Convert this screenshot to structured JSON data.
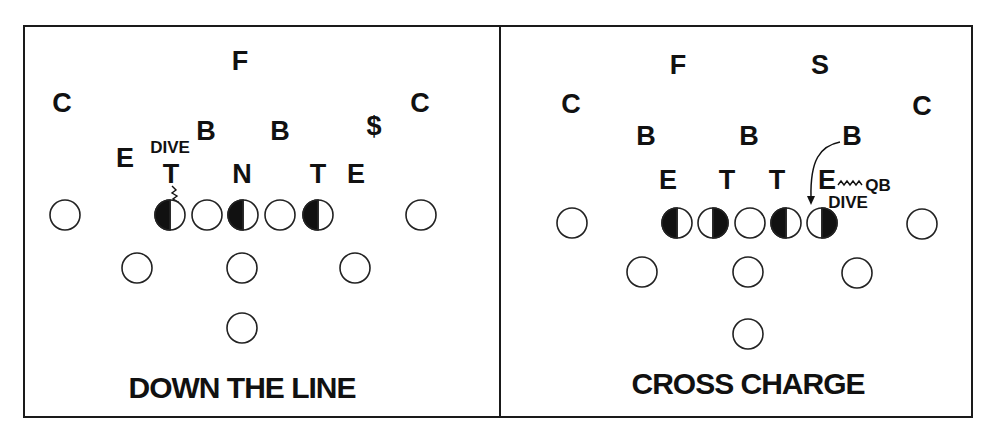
{
  "colors": {
    "ink": "#111111",
    "background": "#ffffff",
    "frame": "#1a1a1a"
  },
  "panels": [
    {
      "id": "down-the-line",
      "caption": "DOWN THE LINE",
      "defenders": [
        {
          "label": "C",
          "role": "corner-left",
          "x": 62,
          "y": 112
        },
        {
          "label": "F",
          "role": "free-safety",
          "x": 240,
          "y": 70
        },
        {
          "label": "C",
          "role": "corner-right",
          "x": 420,
          "y": 112
        },
        {
          "label": "B",
          "role": "backer-left",
          "x": 206,
          "y": 140
        },
        {
          "label": "B",
          "role": "backer-right",
          "x": 280,
          "y": 140
        },
        {
          "label": "$",
          "role": "dollar",
          "x": 374,
          "y": 135
        },
        {
          "label": "E",
          "role": "end-left",
          "x": 125,
          "y": 167
        },
        {
          "label": "T",
          "role": "tackle-left",
          "x": 171,
          "y": 183
        },
        {
          "label": "N",
          "role": "nose",
          "x": 242,
          "y": 183
        },
        {
          "label": "T",
          "role": "tackle-right",
          "x": 318,
          "y": 183
        },
        {
          "label": "E",
          "role": "end-right",
          "x": 356,
          "y": 183
        }
      ],
      "annotations": [
        {
          "text": "DIVE",
          "x": 170,
          "y": 153
        }
      ],
      "offense": {
        "line": [
          {
            "x": 65,
            "y": 215,
            "fill": "none"
          },
          {
            "x": 170,
            "y": 215,
            "fill": "left"
          },
          {
            "x": 207,
            "y": 215,
            "fill": "none"
          },
          {
            "x": 243,
            "y": 215,
            "fill": "left"
          },
          {
            "x": 280,
            "y": 215,
            "fill": "none"
          },
          {
            "x": 318,
            "y": 215,
            "fill": "left"
          },
          {
            "x": 421,
            "y": 215,
            "fill": "none"
          }
        ],
        "backs": [
          {
            "x": 137,
            "y": 268
          },
          {
            "x": 242,
            "y": 268
          },
          {
            "x": 355,
            "y": 268
          },
          {
            "x": 242,
            "y": 328
          }
        ]
      }
    },
    {
      "id": "cross-charge",
      "caption": "CROSS CHARGE",
      "defenders": [
        {
          "label": "F",
          "role": "free-safety",
          "x": 678,
          "y": 74
        },
        {
          "label": "S",
          "role": "strong-safety",
          "x": 820,
          "y": 74
        },
        {
          "label": "C",
          "role": "corner-left",
          "x": 571,
          "y": 113
        },
        {
          "label": "C",
          "role": "corner-right",
          "x": 922,
          "y": 115
        },
        {
          "label": "B",
          "role": "backer-left",
          "x": 646,
          "y": 145
        },
        {
          "label": "B",
          "role": "backer-middle",
          "x": 749,
          "y": 145
        },
        {
          "label": "B",
          "role": "backer-right",
          "x": 852,
          "y": 145
        },
        {
          "label": "E",
          "role": "end-left",
          "x": 668,
          "y": 189
        },
        {
          "label": "T",
          "role": "tackle-left",
          "x": 727,
          "y": 189
        },
        {
          "label": "T",
          "role": "tackle-right",
          "x": 777,
          "y": 189
        },
        {
          "label": "E",
          "role": "end-right",
          "x": 827,
          "y": 189
        }
      ],
      "annotations": [
        {
          "text": "QB",
          "x": 878,
          "y": 191
        },
        {
          "text": "DIVE",
          "x": 848,
          "y": 208
        }
      ],
      "offense": {
        "line": [
          {
            "x": 572,
            "y": 223,
            "fill": "none"
          },
          {
            "x": 677,
            "y": 223,
            "fill": "left"
          },
          {
            "x": 713,
            "y": 223,
            "fill": "right"
          },
          {
            "x": 750,
            "y": 223,
            "fill": "none"
          },
          {
            "x": 786,
            "y": 223,
            "fill": "left"
          },
          {
            "x": 822,
            "y": 223,
            "fill": "right"
          },
          {
            "x": 922,
            "y": 223,
            "fill": "none"
          }
        ],
        "backs": [
          {
            "x": 642,
            "y": 272
          },
          {
            "x": 748,
            "y": 272
          },
          {
            "x": 857,
            "y": 273
          },
          {
            "x": 748,
            "y": 334
          }
        ]
      }
    }
  ]
}
